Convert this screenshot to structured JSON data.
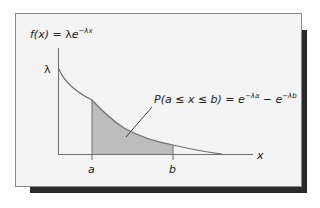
{
  "figure": {
    "function_label": {
      "lhs": "f(x)",
      "eq": " = ",
      "coef": "λ",
      "base": "e",
      "exponent": "−λx"
    },
    "y_tick_label": "λ",
    "x_axis_label": "x",
    "bound_a_label": "a",
    "bound_b_label": "b",
    "probability_label": {
      "text": "P(a ≤ x ≤ b) = ",
      "term1_base": "e",
      "term1_exp": "−λa",
      "minus": " − ",
      "term2_base": "e",
      "term2_exp": "−λb"
    },
    "colors": {
      "card_bg": "#f4f4f4",
      "shade": "#bdbdbd",
      "curve": "#6e6e6e",
      "axis": "#6e6e6e",
      "shadow": "#2a2a2a"
    }
  }
}
